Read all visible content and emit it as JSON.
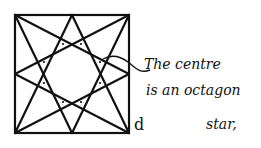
{
  "diagram": {
    "type": "geometric construction",
    "shape": "square with eight-pointed octagon star",
    "corner_label": "d",
    "annotation": {
      "lines": [
        "The centre",
        "is an octagon",
        "star,"
      ]
    },
    "colors": {
      "stroke": "#111111",
      "background": "#ffffff"
    }
  }
}
